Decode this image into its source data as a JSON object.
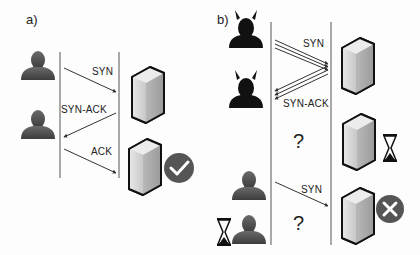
{
  "panels": {
    "a": {
      "label": "a)",
      "messages": {
        "syn": "SYN",
        "syn_ack": "SYN-ACK",
        "ack": "ACK"
      },
      "icons": [
        "user-icon",
        "user-icon",
        "server-icon",
        "server-icon",
        "check-circle-icon"
      ]
    },
    "b": {
      "label": "b)",
      "messages": {
        "syn": "SYN",
        "syn_ack": "SYN-ACK",
        "syn_2": "SYN"
      },
      "unknown_1": "?",
      "unknown_2": "?",
      "icons": [
        "attacker-icon",
        "attacker-icon",
        "server-icon",
        "hourglass-icon",
        "user-icon",
        "user-icon",
        "hourglass-icon",
        "server-icon",
        "x-circle-icon"
      ]
    }
  },
  "colors": {
    "line": "#333333",
    "person": "#4a4a4a",
    "attacker": "#111111",
    "status_circle": "#555555",
    "server_outline": "#111111"
  }
}
